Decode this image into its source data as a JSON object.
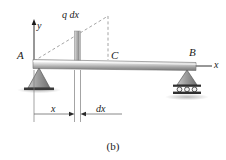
{
  "figure": {
    "caption": "(b)",
    "labels": {
      "point_a": "A",
      "point_b": "B",
      "point_c": "C",
      "axis_y": "y",
      "axis_x": "x",
      "load": "q dx",
      "dim_x": "x",
      "dim_dx": "dx"
    },
    "colors": {
      "line": "#1a1a1a",
      "dashed": "#9a9a9a",
      "beam_light": "#f2f2f2",
      "beam_mid": "#bdbdbd",
      "beam_dark": "#6e6e6e",
      "support_fill": "#9e9e9e",
      "support_edge": "#5a5a5a",
      "ground": "#2b2b2b",
      "shadow": "#d9d9d9"
    },
    "elements": {
      "beam_label": "horizontal beam",
      "left_support": "pin-support",
      "right_support": "roller-support",
      "load_strip": "differential-load-strip",
      "load_line": "triangular-distributed-load",
      "dimension_line": "distance-x-dimension"
    }
  }
}
